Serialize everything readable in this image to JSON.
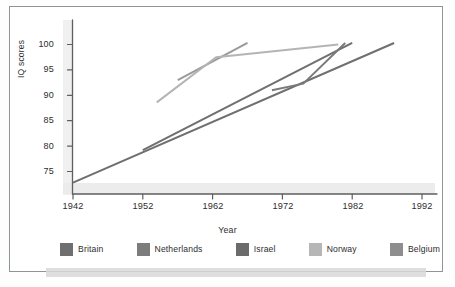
{
  "figure": {
    "kind": "line-chart-scan",
    "background_color": "#ffffff",
    "frame_color": "#8f9499"
  },
  "chart_data": {
    "type": "line",
    "title": "",
    "xlabel": "Year",
    "ylabel": "IQ scores",
    "xlim": [
      1942,
      1994
    ],
    "ylim": [
      71,
      102
    ],
    "xticks": [
      1942,
      1952,
      1962,
      1972,
      1982,
      1992
    ],
    "yticks": [
      75,
      80,
      85,
      90,
      95,
      100
    ],
    "grid": false,
    "legend_position": "bottom",
    "series": [
      {
        "name": "Britain",
        "color": "#6f6f6f",
        "x": [
          1942,
          1988
        ],
        "values": [
          72.8,
          100.3
        ]
      },
      {
        "name": "Netherlands",
        "color": "#6f6f6f",
        "x": [
          1952,
          1982
        ],
        "values": [
          79.2,
          100.3
        ]
      },
      {
        "name": "Israel",
        "color": "#9a9a9a",
        "x": [
          1957,
          1967
        ],
        "values": [
          93.0,
          100.3
        ]
      },
      {
        "name": "Norway",
        "color": "#b4b4b4",
        "x": [
          1954,
          1962.5,
          1980
        ],
        "values": [
          88.6,
          97.5,
          100.0
        ]
      },
      {
        "name": "Belgium",
        "color": "#7a7a7a",
        "x": [
          1970.5,
          1975,
          1981
        ],
        "values": [
          91.0,
          92.3,
          100.3
        ]
      }
    ]
  },
  "axes": {
    "y_title": "IQ scores",
    "x_title": "Year",
    "y_tick_labels": [
      "100",
      "95",
      "90",
      "85",
      "80",
      "75"
    ],
    "x_tick_labels": [
      "1942",
      "1952",
      "1962",
      "1972",
      "1982",
      "1992"
    ]
  },
  "legend": {
    "items": [
      {
        "label": "Britain",
        "color": "#6f6f6f"
      },
      {
        "label": "Netherlands",
        "color": "#7c7c7c"
      },
      {
        "label": "Israel",
        "color": "#6b6b6b"
      },
      {
        "label": "Norway",
        "color": "#b6b6b6"
      },
      {
        "label": "Belgium",
        "color": "#8e8e8e"
      }
    ]
  }
}
